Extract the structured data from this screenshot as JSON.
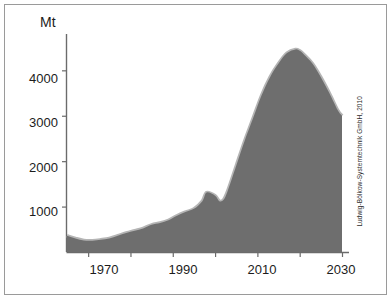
{
  "chart_data": {
    "type": "area",
    "title": "",
    "subtitle": "",
    "xlabel": "",
    "ylabel": "Mt",
    "unit_label": "Mt",
    "xlim": [
      1965,
      2030
    ],
    "ylim": [
      0,
      4800
    ],
    "grid": false,
    "legend": null,
    "y_ticks": [
      1000,
      2000,
      3000,
      4000
    ],
    "y_tick_labels": [
      "1000",
      "2000",
      "3000",
      "4000"
    ],
    "x_ticks": [
      1970,
      1980,
      1990,
      2000,
      2010,
      2020,
      2030
    ],
    "x_tick_labels_shown": [
      "1970",
      "1990",
      "2010",
      "2030"
    ],
    "x_labeled_ticks": [
      1970,
      1990,
      2010,
      2030
    ],
    "series_name": "Global oil production",
    "x": [
      1965,
      1967,
      1969,
      1971,
      1973,
      1975,
      1977,
      1979,
      1981,
      1983,
      1985,
      1987,
      1989,
      1991,
      1993,
      1995,
      1997,
      1998,
      2000,
      2001,
      2002,
      2003,
      2005,
      2007,
      2009,
      2011,
      2013,
      2015,
      2017,
      2019,
      2020,
      2021,
      2023,
      2025,
      2027,
      2029,
      2030
    ],
    "y": [
      360,
      300,
      255,
      250,
      270,
      300,
      360,
      420,
      470,
      520,
      600,
      640,
      700,
      800,
      880,
      950,
      1120,
      1310,
      1240,
      1120,
      1150,
      1350,
      1900,
      2450,
      2950,
      3450,
      3850,
      4150,
      4380,
      4460,
      4430,
      4350,
      4150,
      3850,
      3500,
      3120,
      3000
    ],
    "fill_color": "#6e6e6e",
    "outline_color": "#b5b5b5",
    "axis_color": "#6b6b6b",
    "text_color": "#1c1c1c",
    "peak_value": 4460,
    "peak_year": 2019,
    "end_value": 3000,
    "end_year": 2030,
    "annotation_credit": "Ludwig-Bölkow-Systemtechnik GmbH, 2010"
  },
  "figure": {
    "credit": "Ludwig-Bölkow-Systemtechnik GmbH, 2010",
    "border_color": "#9a9a9a"
  }
}
